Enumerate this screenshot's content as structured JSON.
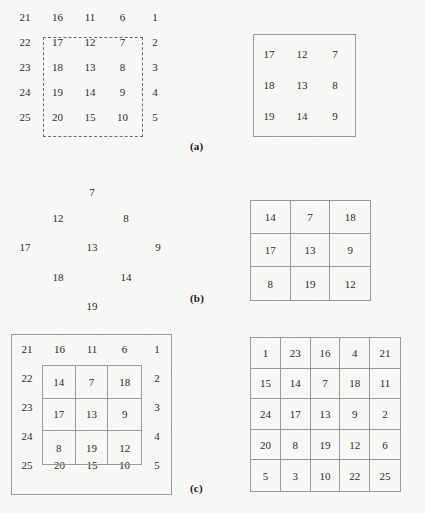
{
  "figure": {
    "background_color": "#f7f7f5",
    "line_color": "#9a9a9a",
    "text_color": "#2b2b2b"
  },
  "panels": {
    "a": {
      "label": "(a)",
      "left": {
        "name": "spiral-5x5-with-dashed-selection",
        "rows": [
          [
            "21",
            "16",
            "11",
            "6",
            "1"
          ],
          [
            "22",
            "17",
            "12",
            "7",
            "2"
          ],
          [
            "23",
            "18",
            "13",
            "8",
            "3"
          ],
          [
            "24",
            "19",
            "14",
            "9",
            "4"
          ],
          [
            "25",
            "20",
            "15",
            "10",
            "5"
          ]
        ],
        "selection": {
          "style": "dashed",
          "row_start": 1,
          "row_end": 3,
          "col_start": 1,
          "col_end": 3
        }
      },
      "right": {
        "name": "extracted-3x3-block-outline-only",
        "rows": [
          [
            "17",
            "12",
            "7"
          ],
          [
            "18",
            "13",
            "8"
          ],
          [
            "19",
            "14",
            "9"
          ]
        ]
      }
    },
    "b": {
      "label": "(b)",
      "left": {
        "name": "rotated-diamond-3x3",
        "points": [
          {
            "value": "7",
            "x": 92,
            "y": 193
          },
          {
            "value": "12",
            "x": 58,
            "y": 219
          },
          {
            "value": "8",
            "x": 126,
            "y": 219
          },
          {
            "value": "17",
            "x": 25,
            "y": 248
          },
          {
            "value": "13",
            "x": 92,
            "y": 248
          },
          {
            "value": "9",
            "x": 158,
            "y": 248
          },
          {
            "value": "18",
            "x": 58,
            "y": 278
          },
          {
            "value": "14",
            "x": 126,
            "y": 278
          },
          {
            "value": "19",
            "x": 92,
            "y": 307
          }
        ]
      },
      "right": {
        "name": "rotated-3x3-grid",
        "rows": [
          [
            "14",
            "7",
            "18"
          ],
          [
            "17",
            "13",
            "9"
          ],
          [
            "8",
            "19",
            "12"
          ]
        ]
      }
    },
    "c": {
      "label": "(c)",
      "left": {
        "name": "spiral-5x5-with-rotated-inner-3x3",
        "outer_rows": [
          [
            "21",
            "16",
            "11",
            "6",
            "1"
          ],
          [
            "22",
            "",
            "",
            "",
            "2"
          ],
          [
            "23",
            "",
            "",
            "",
            "3"
          ],
          [
            "24",
            "",
            "",
            "",
            "4"
          ],
          [
            "25",
            "20",
            "15",
            "10",
            "5"
          ]
        ],
        "inner_rows": [
          [
            "14",
            "7",
            "18"
          ],
          [
            "17",
            "13",
            "9"
          ],
          [
            "8",
            "19",
            "12"
          ]
        ]
      },
      "right": {
        "name": "result-5x5-grid",
        "rows": [
          [
            "1",
            "23",
            "16",
            "4",
            "21"
          ],
          [
            "15",
            "14",
            "7",
            "18",
            "11"
          ],
          [
            "24",
            "17",
            "13",
            "9",
            "2"
          ],
          [
            "20",
            "8",
            "19",
            "12",
            "6"
          ],
          [
            "5",
            "3",
            "10",
            "22",
            "25"
          ]
        ]
      }
    }
  }
}
